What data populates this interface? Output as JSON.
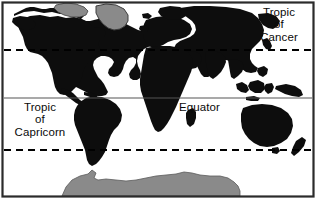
{
  "figure": {
    "width": 316,
    "height": 199
  },
  "colors": {
    "ocean": "#ffffff",
    "landmass": "#0d0d0d",
    "ice_sheet": "#8a8a8a",
    "ice_outline": "#3c3c3c",
    "border": "#2b2b2b",
    "equator_line": "#555555",
    "tropic_line": "#000000",
    "label_text": "#0a0a0a"
  },
  "labels": {
    "tropic_of_cancer": {
      "line1": "Tropic",
      "line2": "of",
      "line3": "Cancer"
    },
    "tropic_of_capricorn": {
      "line1": "Tropic",
      "line2": "of",
      "line3": "Capricorn"
    },
    "equator": "Equator"
  },
  "latitude_lines": [
    {
      "name": "tropic-of-cancer",
      "label": "Tropic of Cancer",
      "style": "dashed",
      "y": 50
    },
    {
      "name": "equator",
      "label": "Equator",
      "style": "solid",
      "y": 98
    },
    {
      "name": "tropic-of-capricorn",
      "label": "Tropic of Capricorn",
      "style": "dashed",
      "y": 150
    }
  ],
  "landmasses": [
    "north-america",
    "greenland",
    "canadian-arctic-archipelago",
    "south-america",
    "europe",
    "africa",
    "madagascar",
    "asia",
    "southeast-asia-islands",
    "new-guinea",
    "australia",
    "new-zealand",
    "antarctica"
  ]
}
